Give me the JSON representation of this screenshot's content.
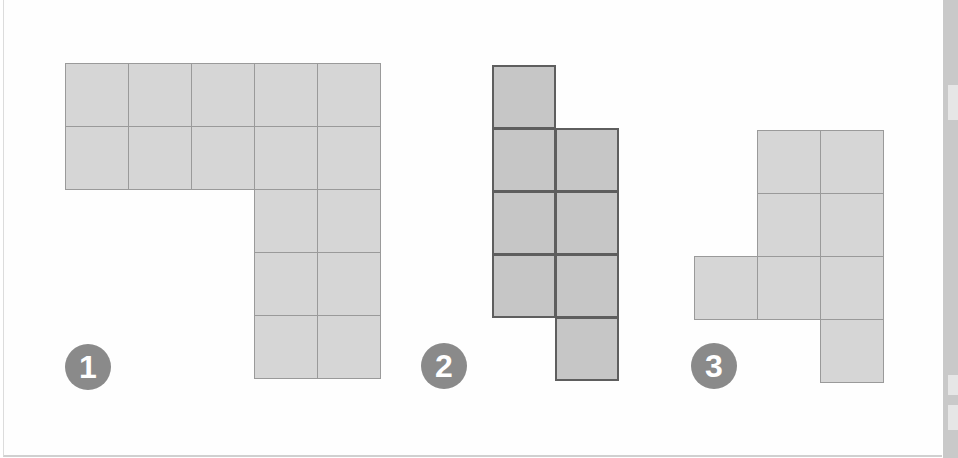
{
  "figure": {
    "colors": {
      "light_fill": "#d6d6d6",
      "light_line": "#9a9a9a",
      "dark_fill": "#c6c6c6",
      "dark_line": "#5e5e5e",
      "badge": "#8a8a8a"
    },
    "shapes": [
      {
        "label": "1",
        "style": "light",
        "origin": [
          65,
          63
        ],
        "cell_size": 63,
        "cells": [
          [
            0,
            0
          ],
          [
            1,
            0
          ],
          [
            2,
            0
          ],
          [
            3,
            0
          ],
          [
            4,
            0
          ],
          [
            0,
            1
          ],
          [
            1,
            1
          ],
          [
            2,
            1
          ],
          [
            3,
            1
          ],
          [
            4,
            1
          ],
          [
            3,
            2
          ],
          [
            4,
            2
          ],
          [
            3,
            3
          ],
          [
            4,
            3
          ],
          [
            3,
            4
          ],
          [
            4,
            4
          ]
        ]
      },
      {
        "label": "2",
        "style": "dark",
        "origin": [
          492,
          65
        ],
        "cell_size": 63,
        "cells": [
          [
            0,
            0
          ],
          [
            0,
            1
          ],
          [
            1,
            1
          ],
          [
            0,
            2
          ],
          [
            1,
            2
          ],
          [
            0,
            3
          ],
          [
            1,
            3
          ],
          [
            1,
            4
          ]
        ]
      },
      {
        "label": "3",
        "style": "light",
        "origin": [
          694,
          130
        ],
        "cell_size": 63,
        "cells": [
          [
            1,
            0
          ],
          [
            2,
            0
          ],
          [
            1,
            1
          ],
          [
            2,
            1
          ],
          [
            0,
            2
          ],
          [
            1,
            2
          ],
          [
            2,
            2
          ],
          [
            2,
            3
          ]
        ]
      }
    ],
    "badges": [
      {
        "label": "1",
        "center": [
          88,
          367
        ]
      },
      {
        "label": "2",
        "center": [
          444,
          366
        ]
      },
      {
        "label": "3",
        "center": [
          714,
          366
        ]
      }
    ]
  }
}
